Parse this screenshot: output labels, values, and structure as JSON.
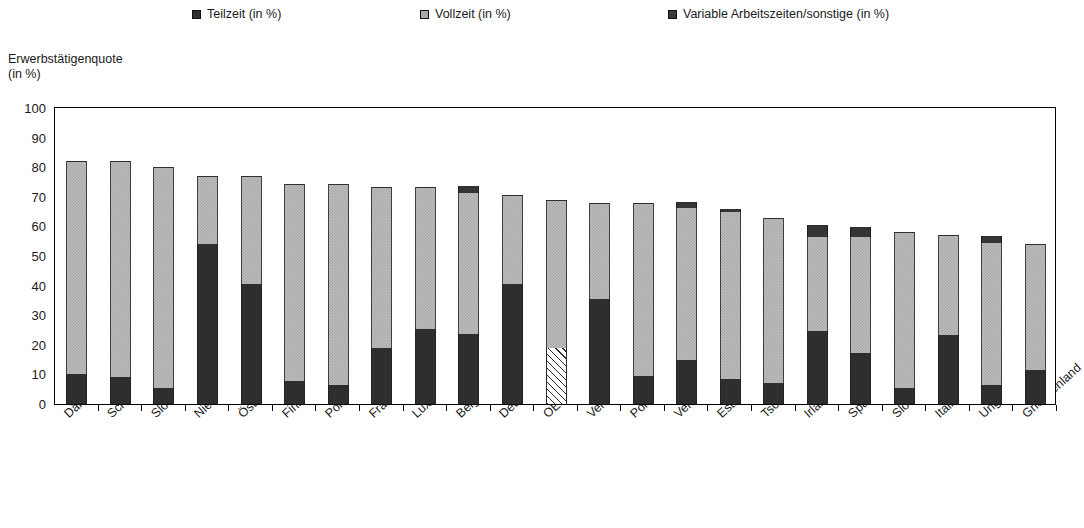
{
  "legend": {
    "items": [
      {
        "label": "Teilzeit (in %)",
        "icon": "square-dark-icon",
        "color": "#2f2f2f"
      },
      {
        "label": "Vollzeit (in %)",
        "icon": "square-hatch-gray-icon",
        "color": "#b8b8b8"
      },
      {
        "label": "Variable Arbeitszeiten/sonstige (in %)",
        "icon": "square-dark-icon",
        "color": "#3a3a3a"
      }
    ]
  },
  "axis": {
    "y_title": "Erwerbstätigenquote\n(in %)",
    "y_ticks": [
      "100",
      "90",
      "80",
      "70",
      "60",
      "50",
      "40",
      "30",
      "20",
      "10",
      "0"
    ]
  },
  "chart_data": {
    "type": "bar",
    "subtype": "stacked",
    "title": "",
    "xlabel": "",
    "ylabel": "Erwerbstätigenquote (in %)",
    "ylim": [
      0,
      100
    ],
    "ytick_step": 10,
    "grid": false,
    "legend_position": "top",
    "categories": [
      "Dänemark",
      "Schweden",
      "Slowenien",
      "Niederlande",
      "Österreich",
      "Finnland",
      "Portugal",
      "Frankreich",
      "Luxemburg",
      "Belgien",
      "Deutschland",
      "OECD22-Durchschnitt",
      "Ver. Königreich",
      "Polen",
      "Ver. Staaten",
      "Estland",
      "Tschech. Rep.",
      "Irland",
      "Spanien",
      "Slowak. Rep.",
      "Italien",
      "Ungarn",
      "Griechenland"
    ],
    "series": [
      {
        "name": "Teilzeit (in %)",
        "color": "#2e2e2e",
        "values": [
          10.0,
          9.2,
          5.5,
          54.0,
          40.5,
          7.8,
          6.5,
          18.8,
          25.5,
          23.5,
          40.5,
          19.0,
          35.5,
          9.3,
          14.8,
          8.3,
          7.2,
          24.5,
          17.3,
          5.3,
          23.2,
          6.5,
          11.5
        ]
      },
      {
        "name": "Vollzeit (in %)",
        "color": "#bdbdbd",
        "values": [
          72.0,
          72.8,
          74.5,
          23.0,
          36.5,
          66.5,
          67.8,
          54.5,
          47.8,
          47.8,
          30.0,
          49.5,
          32.5,
          58.5,
          51.5,
          56.7,
          55.5,
          32.0,
          39.2,
          52.7,
          34.0,
          48.0,
          42.5
        ]
      },
      {
        "name": "Variable Arbeitszeiten/sonstige (in %)",
        "color": "#353535",
        "values": [
          0.0,
          0.0,
          0.0,
          0.0,
          0.0,
          0.0,
          0.0,
          0.0,
          0.0,
          2.2,
          0.0,
          0.5,
          0.0,
          0.0,
          2.0,
          1.0,
          0.0,
          4.0,
          3.2,
          0.0,
          0.0,
          2.3,
          0.0
        ]
      }
    ],
    "totals": [
      82.0,
      82.0,
      80.0,
      77.0,
      77.0,
      74.3,
      74.3,
      73.3,
      73.3,
      73.5,
      70.5,
      69.0,
      68.0,
      67.8,
      68.3,
      66.0,
      62.7,
      60.5,
      59.7,
      58.0,
      57.2,
      56.8,
      54.0
    ],
    "special_pattern": {
      "category": "OECD22-Durchschnitt",
      "series": "Teilzeit (in %)",
      "pattern": "diagonal-hatch"
    }
  }
}
